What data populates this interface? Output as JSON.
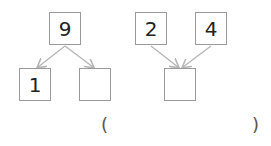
{
  "diagram": {
    "split": {
      "top": "9",
      "left": "1",
      "right": ""
    },
    "combine": {
      "left": "2",
      "right": "4",
      "bottom": ""
    },
    "answer": {
      "open_paren": "(",
      "close_paren": ")",
      "value": ""
    },
    "colors": {
      "box_border": "#9a9a9a",
      "arrow": "#b5b5b5",
      "text": "#222222"
    }
  }
}
